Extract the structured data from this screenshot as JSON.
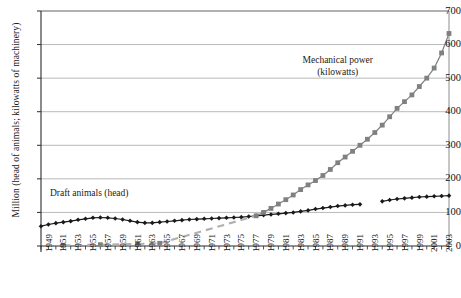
{
  "chart_data": {
    "type": "line",
    "title": "",
    "xlabel": "",
    "ylabel": "Million (head of animals; kilowatts of machinery)",
    "ylim": [
      0,
      700
    ],
    "ytick_values": [
      0,
      100,
      200,
      300,
      400,
      500,
      600,
      700
    ],
    "ytick_labels": [
      "0",
      "100",
      "200",
      "300",
      "400",
      "500",
      "600",
      "700"
    ],
    "xlim": [
      1949,
      2004
    ],
    "xtick_labels": [
      "1949",
      "1951",
      "1953",
      "1955",
      "1957",
      "1959",
      "1961",
      "1963",
      "1965",
      "1967",
      "1969",
      "1971",
      "1973",
      "1975",
      "1977",
      "1979",
      "1981",
      "1983",
      "1985",
      "1987",
      "1989",
      "1991",
      "1993",
      "1995",
      "1997",
      "1999",
      "2001",
      "2003"
    ],
    "grid": "horizontal",
    "legend_position": "inline-annotations",
    "annotations": [
      {
        "name": "draft-animals-label",
        "text": "Draft animals (head)",
        "x": 1955.5,
        "y": 150
      },
      {
        "name": "mechanical-power-label",
        "text": "Mechanical power\n(kilowatts)",
        "x": 1989,
        "y": 545
      }
    ],
    "series": [
      {
        "name": "Draft animals (head)",
        "marker": "diamond",
        "color": "#1a1a1a",
        "x": [
          1949,
          1950,
          1951,
          1952,
          1953,
          1954,
          1955,
          1956,
          1957,
          1958,
          1959,
          1960,
          1961,
          1962,
          1963,
          1964,
          1965,
          1966,
          1967,
          1968,
          1969,
          1970,
          1971,
          1972,
          1973,
          1974,
          1975,
          1976,
          1977,
          1978,
          1979,
          1980,
          1981,
          1982,
          1983,
          1984,
          1985,
          1986,
          1987,
          1988,
          1989,
          1990,
          1991,
          1992,
          1995,
          1996,
          1997,
          1998,
          1999,
          2000,
          2001,
          2002,
          2003,
          2004
        ],
        "values": [
          59,
          64,
          68,
          71,
          74,
          78,
          81,
          84,
          85,
          84,
          82,
          79,
          75,
          71,
          69,
          69,
          71,
          73,
          75,
          77,
          79,
          80,
          81,
          82,
          83,
          84,
          85,
          86,
          88,
          90,
          92,
          94,
          96,
          98,
          100,
          103,
          106,
          110,
          113,
          116,
          119,
          121,
          123,
          124,
          133,
          137,
          140,
          142,
          144,
          146,
          147,
          148,
          149,
          150
        ]
      },
      {
        "name": "Mechanical power (kilowatts)",
        "marker": "square",
        "color": "#808080",
        "x": [
          1952,
          1957,
          1962,
          1965,
          1978,
          1979,
          1980,
          1981,
          1982,
          1983,
          1984,
          1985,
          1986,
          1987,
          1988,
          1989,
          1990,
          1991,
          1992,
          1993,
          1994,
          1995,
          1996,
          1997,
          1998,
          1999,
          2000,
          2001,
          2002,
          2003,
          2004
        ],
        "values": [
          2,
          4,
          6,
          8,
          90,
          100,
          112,
          125,
          138,
          152,
          168,
          182,
          195,
          210,
          228,
          248,
          265,
          282,
          300,
          318,
          338,
          360,
          385,
          410,
          430,
          450,
          475,
          500,
          530,
          575,
          633
        ],
        "dashed_segment": {
          "from_x": 1965,
          "to_x": 1978,
          "note": "interpolated dashed gray line"
        }
      }
    ]
  }
}
